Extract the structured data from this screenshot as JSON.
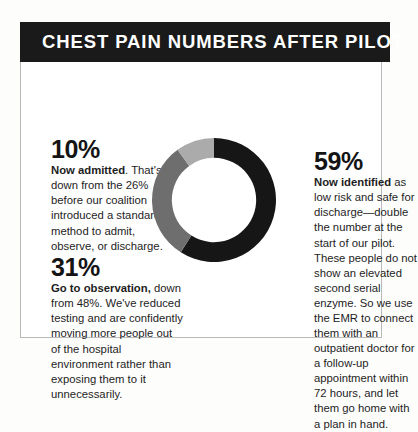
{
  "header": {
    "title": "CHEST PAIN NUMBERS AFTER PILOT",
    "background_color": "#1a1a1a",
    "text_color": "#ffffff"
  },
  "stats": [
    {
      "id": "admitted",
      "number": "10%",
      "lead": "Now admitted",
      "rest": ". That's down from the 26% before our coalition introduced a standard method to admit, observe, or discharge.",
      "color": "#ababab"
    },
    {
      "id": "observation",
      "number": "31%",
      "lead": "Go to observation,",
      "rest": " down from 48%. We've reduced testing and are confidently moving more people out of the hospital environment rather than exposing them to it unnecessarily.",
      "color": "#6e6e6e"
    },
    {
      "id": "identified",
      "number": "59%",
      "lead": "Now identified",
      "rest": " as low risk and safe for discharge—double the number at the start of our pilot. These people do not show an elevated second serial enzyme. So we use the EMR to connect them with an outpatient doctor for a follow-up appointment within 72 hours, and let them go home with a plan in hand.",
      "color": "#161616"
    }
  ],
  "chart_data": {
    "type": "pie",
    "title": "CHEST PAIN NUMBERS AFTER PILOT",
    "subtype": "donut",
    "units": "percent",
    "start_angle_deg": 0,
    "direction": "clockwise",
    "categories": [
      "Now identified as low risk and safe for discharge",
      "Go to observation",
      "Now admitted"
    ],
    "values": [
      59,
      31,
      10
    ],
    "colors": [
      "#161616",
      "#6e6e6e",
      "#ababab"
    ],
    "legend": "none",
    "labels_shown": false,
    "inner_radius_ratio": 0.68
  }
}
